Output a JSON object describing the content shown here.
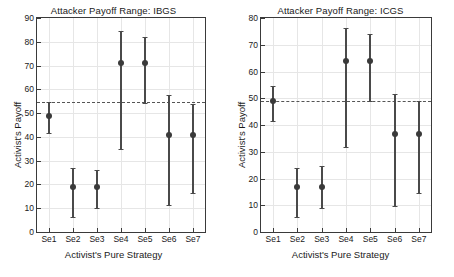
{
  "figure": {
    "width": 454,
    "height": 277,
    "background": "#ffffff",
    "marker_color": "#3a3a3a",
    "bar_color": "#4a4a4a",
    "grid_color": "#e6e6e6",
    "refline_color": "#555555"
  },
  "chart_data": [
    {
      "type": "scatter",
      "panel": "left",
      "title": "Attacker Payoff Range: IBGS",
      "xlabel": "Activist's Pure Strategy",
      "ylabel": "Activist's Payoff",
      "categories": [
        "Se1",
        "Se2",
        "Se3",
        "Se4",
        "Se5",
        "Se6",
        "Se7"
      ],
      "values": [
        48.8,
        19.0,
        19.0,
        71.2,
        71.1,
        40.8,
        40.8
      ],
      "lower": [
        41.7,
        6.3,
        10.0,
        35.1,
        54.2,
        11.2,
        16.6
      ],
      "upper": [
        54.5,
        26.8,
        26.2,
        84.5,
        82.0,
        57.5,
        53.9
      ],
      "ylim": [
        0,
        90
      ],
      "yticks": [
        0,
        10,
        20,
        30,
        40,
        50,
        60,
        70,
        80,
        90
      ],
      "ytick_labels": [
        "0",
        "10",
        "20",
        "30",
        "40",
        "50",
        "60",
        "70",
        "80",
        "90"
      ],
      "reference_line": 54.5,
      "reference_line_style": "dashed",
      "grid": true,
      "legend": "none"
    },
    {
      "type": "scatter",
      "panel": "right",
      "title": "Attacker Payoff Range: ICGS",
      "xlabel": "Activist's Pure Strategy",
      "ylabel": "Activist's Payoff",
      "categories": [
        "Se1",
        "Se2",
        "Se3",
        "Se4",
        "Se5",
        "Se6",
        "Se7"
      ],
      "values": [
        48.8,
        17.0,
        17.0,
        63.8,
        63.8,
        36.8,
        36.8
      ],
      "lower": [
        41.6,
        5.7,
        8.9,
        31.6,
        48.8,
        9.9,
        14.5
      ],
      "upper": [
        54.5,
        24.0,
        24.5,
        76.3,
        74.0,
        51.7,
        48.8
      ],
      "ylim": [
        0,
        80
      ],
      "yticks": [
        0,
        10,
        20,
        30,
        40,
        50,
        60,
        70,
        80
      ],
      "ytick_labels": [
        "0",
        "10",
        "20",
        "30",
        "40",
        "50",
        "60",
        "70",
        "80"
      ],
      "reference_line": 49.0,
      "reference_line_style": "dashed",
      "grid": true,
      "legend": "none"
    }
  ]
}
